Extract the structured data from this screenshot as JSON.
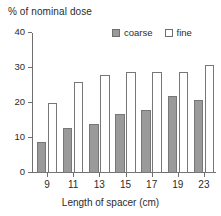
{
  "chart_data": {
    "type": "bar",
    "title": "% of nominal dose",
    "xlabel": "Length of spacer  (cm)",
    "ylabel": "% of nominal dose",
    "categories": [
      "9",
      "11",
      "13",
      "15",
      "17",
      "19",
      "23"
    ],
    "ylim": [
      0,
      40
    ],
    "yticks": [
      0,
      10,
      20,
      30,
      40
    ],
    "ytick_labels": [
      "0",
      "10",
      "20",
      "30",
      "40"
    ],
    "grid": false,
    "legend_position": "top-right",
    "series": [
      {
        "name": "coarse",
        "color": "#9a9a9a",
        "values": [
          9,
          13,
          14,
          17,
          18,
          22,
          21
        ]
      },
      {
        "name": "fine",
        "color": "#ffffff",
        "values": [
          20,
          26,
          28,
          29,
          29,
          29,
          31
        ]
      }
    ]
  },
  "legend": {
    "items": [
      {
        "label": "coarse",
        "style": "filled"
      },
      {
        "label": "fine",
        "style": "hollow"
      }
    ]
  },
  "axis": {
    "x_title": "Length of spacer  (cm)"
  }
}
